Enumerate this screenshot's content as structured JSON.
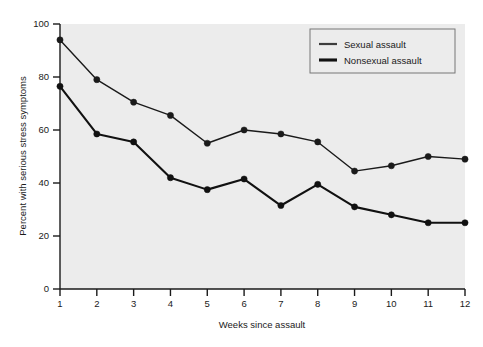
{
  "chart_data": {
    "type": "line",
    "title": "",
    "xlabel": "Weeks since assault",
    "ylabel": "Percent with serious stress symptoms",
    "x": [
      1,
      2,
      3,
      4,
      5,
      6,
      7,
      8,
      9,
      10,
      11,
      12
    ],
    "xtick_labels": [
      "1",
      "2",
      "3",
      "4",
      "5",
      "6",
      "7",
      "8",
      "9",
      "10",
      "11",
      "12"
    ],
    "ytick_labels": [
      "0",
      "20",
      "40",
      "60",
      "80",
      "100"
    ],
    "yticks": [
      0,
      20,
      40,
      60,
      80,
      100
    ],
    "xlim": [
      1,
      12
    ],
    "ylim": [
      0,
      100
    ],
    "grid": false,
    "legend_position": "top-right",
    "plot_background": "#ececec",
    "series": [
      {
        "name": "Sexual assault",
        "color": "#1a1a1a",
        "line_width": 1.4,
        "marker": "circle",
        "values": [
          94,
          79,
          70.5,
          65.5,
          55,
          60,
          58.5,
          55.5,
          44.5,
          46.5,
          50,
          49
        ]
      },
      {
        "name": "Nonsexual assault",
        "color": "#111111",
        "line_width": 2.1,
        "marker": "circle",
        "values": [
          76.5,
          58.5,
          55.5,
          42,
          37.5,
          41.5,
          31.5,
          39.5,
          31,
          28,
          25,
          25
        ]
      }
    ]
  },
  "legend": {
    "entries": [
      {
        "label": "Sexual assault"
      },
      {
        "label": "Nonsexual assault"
      }
    ]
  }
}
